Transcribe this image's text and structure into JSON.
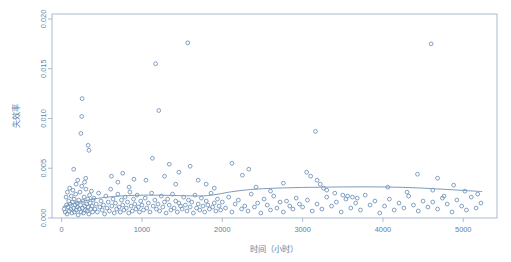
{
  "chart_data": {
    "type": "scatter",
    "title": "",
    "subtitle": "",
    "xlabel": "时间（小时）",
    "ylabel": "失效率",
    "xlim": [
      -120,
      5420
    ],
    "ylim": [
      0.0,
      0.0205
    ],
    "xticks": [
      0,
      1000,
      2000,
      3000,
      4000,
      5000
    ],
    "xtick_labels": [
      "0",
      "1000",
      "2000",
      "3000",
      "4000",
      "5000"
    ],
    "yticks": [
      0.0,
      0.005,
      0.01,
      0.015,
      0.02
    ],
    "ytick_labels": [
      "0.000",
      "0.005",
      "0.010",
      "0.015",
      "0.020"
    ],
    "grid": false,
    "legend": null,
    "legend_position": "none",
    "point_style": "open-circle",
    "point_color": "#6b8fb8",
    "curve_color": "#7d9bbd",
    "frame_color": "#9fb4cc",
    "axis_text_color": "#5b7fa6",
    "background_color": "#ffffff",
    "series": [
      {
        "name": "观测失效率",
        "type": "scatter",
        "points": [
          [
            30,
            0.0009
          ],
          [
            45,
            0.0006
          ],
          [
            55,
            0.0021
          ],
          [
            60,
            0.0013
          ],
          [
            68,
            0.0004
          ],
          [
            72,
            0.0026
          ],
          [
            80,
            0.0011
          ],
          [
            88,
            0.0017
          ],
          [
            95,
            0.0007
          ],
          [
            100,
            0.003
          ],
          [
            108,
            0.0014
          ],
          [
            115,
            0.0009
          ],
          [
            120,
            0.0022
          ],
          [
            128,
            0.0005
          ],
          [
            135,
            0.0016
          ],
          [
            140,
            0.0028
          ],
          [
            148,
            0.001
          ],
          [
            155,
            0.0019
          ],
          [
            160,
            0.0006
          ],
          [
            168,
            0.0013
          ],
          [
            175,
            0.0024
          ],
          [
            182,
            0.0008
          ],
          [
            190,
            0.0015
          ],
          [
            196,
            0.0011
          ],
          [
            205,
            0.0003
          ],
          [
            212,
            0.0018
          ],
          [
            220,
            0.0009
          ],
          [
            228,
            0.0026
          ],
          [
            235,
            0.0013
          ],
          [
            242,
            0.0006
          ],
          [
            250,
            0.0032
          ],
          [
            258,
            0.001
          ],
          [
            265,
            0.0017
          ],
          [
            272,
            0.0005
          ],
          [
            280,
            0.0021
          ],
          [
            288,
            0.0012
          ],
          [
            295,
            0.0008
          ],
          [
            302,
            0.0029
          ],
          [
            310,
            0.0014
          ],
          [
            318,
            0.0007
          ],
          [
            325,
            0.0019
          ],
          [
            332,
            0.0011
          ],
          [
            340,
            0.0004
          ],
          [
            348,
            0.0023
          ],
          [
            355,
            0.0015
          ],
          [
            362,
            0.0009
          ],
          [
            370,
            0.0027
          ],
          [
            378,
            0.0012
          ],
          [
            385,
            0.0006
          ],
          [
            392,
            0.0018
          ],
          [
            150,
            0.0049
          ],
          [
            240,
            0.0085
          ],
          [
            250,
            0.0102
          ],
          [
            255,
            0.012
          ],
          [
            330,
            0.0073
          ],
          [
            340,
            0.0068
          ],
          [
            300,
            0.004
          ],
          [
            285,
            0.0036
          ],
          [
            200,
            0.0038
          ],
          [
            180,
            0.0034
          ],
          [
            400,
            0.002
          ],
          [
            415,
            0.0009
          ],
          [
            430,
            0.0014
          ],
          [
            445,
            0.0006
          ],
          [
            460,
            0.0025
          ],
          [
            475,
            0.0011
          ],
          [
            490,
            0.0017
          ],
          [
            505,
            0.0008
          ],
          [
            520,
            0.0013
          ],
          [
            535,
            0.0004
          ],
          [
            550,
            0.0022
          ],
          [
            565,
            0.001
          ],
          [
            580,
            0.0016
          ],
          [
            595,
            0.0007
          ],
          [
            610,
            0.0029
          ],
          [
            625,
            0.0012
          ],
          [
            640,
            0.0019
          ],
          [
            655,
            0.0005
          ],
          [
            670,
            0.0015
          ],
          [
            685,
            0.0009
          ],
          [
            700,
            0.0024
          ],
          [
            715,
            0.0011
          ],
          [
            730,
            0.0006
          ],
          [
            745,
            0.0018
          ],
          [
            760,
            0.0013
          ],
          [
            775,
            0.0008
          ],
          [
            790,
            0.0021
          ],
          [
            805,
            0.001
          ],
          [
            820,
            0.0016
          ],
          [
            835,
            0.0005
          ],
          [
            850,
            0.0026
          ],
          [
            865,
            0.0012
          ],
          [
            880,
            0.0007
          ],
          [
            895,
            0.0019
          ],
          [
            910,
            0.0014
          ],
          [
            925,
            0.0009
          ],
          [
            940,
            0.0023
          ],
          [
            955,
            0.0011
          ],
          [
            970,
            0.0006
          ],
          [
            985,
            0.0017
          ],
          [
            620,
            0.0042
          ],
          [
            700,
            0.0036
          ],
          [
            760,
            0.0045
          ],
          [
            840,
            0.0031
          ],
          [
            900,
            0.0039
          ],
          [
            1000,
            0.0013
          ],
          [
            1020,
            0.0008
          ],
          [
            1040,
            0.002
          ],
          [
            1060,
            0.001
          ],
          [
            1080,
            0.0015
          ],
          [
            1100,
            0.0006
          ],
          [
            1120,
            0.0025
          ],
          [
            1140,
            0.0012
          ],
          [
            1160,
            0.0018
          ],
          [
            1180,
            0.0009
          ],
          [
            1200,
            0.0014
          ],
          [
            1220,
            0.0007
          ],
          [
            1240,
            0.0022
          ],
          [
            1260,
            0.0011
          ],
          [
            1280,
            0.0016
          ],
          [
            1300,
            0.0005
          ],
          [
            1320,
            0.0019
          ],
          [
            1340,
            0.0013
          ],
          [
            1360,
            0.0008
          ],
          [
            1380,
            0.0024
          ],
          [
            1400,
            0.001
          ],
          [
            1420,
            0.0017
          ],
          [
            1440,
            0.0006
          ],
          [
            1460,
            0.0015
          ],
          [
            1480,
            0.0012
          ],
          [
            1170,
            0.0155
          ],
          [
            1210,
            0.0108
          ],
          [
            1130,
            0.006
          ],
          [
            1280,
            0.0042
          ],
          [
            1340,
            0.0054
          ],
          [
            1050,
            0.0038
          ],
          [
            1420,
            0.0034
          ],
          [
            1460,
            0.0046
          ],
          [
            1500,
            0.0009
          ],
          [
            1520,
            0.0021
          ],
          [
            1540,
            0.0013
          ],
          [
            1560,
            0.0007
          ],
          [
            1580,
            0.0018
          ],
          [
            1600,
            0.0011
          ],
          [
            1620,
            0.0016
          ],
          [
            1640,
            0.0005
          ],
          [
            1660,
            0.0023
          ],
          [
            1680,
            0.001
          ],
          [
            1700,
            0.0014
          ],
          [
            1720,
            0.0008
          ],
          [
            1740,
            0.002
          ],
          [
            1760,
            0.0012
          ],
          [
            1780,
            0.0006
          ],
          [
            1800,
            0.0017
          ],
          [
            1820,
            0.0013
          ],
          [
            1840,
            0.0009
          ],
          [
            1860,
            0.0025
          ],
          [
            1880,
            0.0011
          ],
          [
            1900,
            0.0015
          ],
          [
            1920,
            0.0007
          ],
          [
            1940,
            0.0019
          ],
          [
            1960,
            0.0012
          ],
          [
            1980,
            0.0008
          ],
          [
            1570,
            0.0176
          ],
          [
            1600,
            0.0052
          ],
          [
            1700,
            0.0038
          ],
          [
            1800,
            0.0034
          ],
          [
            1900,
            0.003
          ],
          [
            2000,
            0.0016
          ],
          [
            2040,
            0.001
          ],
          [
            2080,
            0.0021
          ],
          [
            2120,
            0.0006
          ],
          [
            2160,
            0.0014
          ],
          [
            2200,
            0.0018
          ],
          [
            2240,
            0.0009
          ],
          [
            2280,
            0.0012
          ],
          [
            2320,
            0.0007
          ],
          [
            2360,
            0.0024
          ],
          [
            2400,
            0.0011
          ],
          [
            2440,
            0.0015
          ],
          [
            2480,
            0.0005
          ],
          [
            2520,
            0.0019
          ],
          [
            2560,
            0.0013
          ],
          [
            2600,
            0.0008
          ],
          [
            2640,
            0.0022
          ],
          [
            2680,
            0.001
          ],
          [
            2720,
            0.0016
          ],
          [
            2760,
            0.0006
          ],
          [
            2800,
            0.0017
          ],
          [
            2840,
            0.0012
          ],
          [
            2880,
            0.0009
          ],
          [
            2920,
            0.002
          ],
          [
            2960,
            0.0014
          ],
          [
            2120,
            0.0055
          ],
          [
            2250,
            0.0043
          ],
          [
            2420,
            0.0031
          ],
          [
            2600,
            0.0027
          ],
          [
            2760,
            0.0035
          ],
          [
            2330,
            0.0049
          ],
          [
            3000,
            0.0011
          ],
          [
            3060,
            0.0018
          ],
          [
            3120,
            0.0007
          ],
          [
            3180,
            0.0014
          ],
          [
            3240,
            0.0009
          ],
          [
            3300,
            0.0021
          ],
          [
            3360,
            0.0012
          ],
          [
            3420,
            0.0016
          ],
          [
            3480,
            0.0006
          ],
          [
            3540,
            0.0019
          ],
          [
            3600,
            0.001
          ],
          [
            3660,
            0.0015
          ],
          [
            3720,
            0.0008
          ],
          [
            3780,
            0.0023
          ],
          [
            3840,
            0.0013
          ],
          [
            3900,
            0.0017
          ],
          [
            3960,
            0.0005
          ],
          [
            3160,
            0.0087
          ],
          [
            3100,
            0.0042
          ],
          [
            3180,
            0.0038
          ],
          [
            3220,
            0.0034
          ],
          [
            3260,
            0.003
          ],
          [
            3300,
            0.0028
          ],
          [
            3400,
            0.0025
          ],
          [
            3500,
            0.0023
          ],
          [
            3560,
            0.0022
          ],
          [
            3620,
            0.0021
          ],
          [
            3680,
            0.002
          ],
          [
            3050,
            0.0046
          ],
          [
            4020,
            0.0012
          ],
          [
            4080,
            0.0019
          ],
          [
            4140,
            0.0008
          ],
          [
            4200,
            0.0015
          ],
          [
            4260,
            0.001
          ],
          [
            4320,
            0.0022
          ],
          [
            4380,
            0.0013
          ],
          [
            4440,
            0.0007
          ],
          [
            4500,
            0.0017
          ],
          [
            4560,
            0.0011
          ],
          [
            4620,
            0.0016
          ],
          [
            4680,
            0.0009
          ],
          [
            4740,
            0.002
          ],
          [
            4800,
            0.0014
          ],
          [
            4860,
            0.0006
          ],
          [
            4920,
            0.0018
          ],
          [
            4980,
            0.0012
          ],
          [
            5040,
            0.0008
          ],
          [
            5100,
            0.0021
          ],
          [
            5160,
            0.001
          ],
          [
            5220,
            0.0015
          ],
          [
            4600,
            0.0175
          ],
          [
            4060,
            0.0031
          ],
          [
            4430,
            0.0044
          ],
          [
            4680,
            0.004
          ],
          [
            4620,
            0.0028
          ],
          [
            4880,
            0.0033
          ],
          [
            5020,
            0.0027
          ],
          [
            5180,
            0.0024
          ],
          [
            4300,
            0.0026
          ],
          [
            4760,
            0.0022
          ]
        ]
      },
      {
        "name": "平滑拟合曲线",
        "type": "line",
        "points": [
          [
            20,
            0.00115
          ],
          [
            150,
            0.00145
          ],
          [
            300,
            0.00175
          ],
          [
            450,
            0.00198
          ],
          [
            650,
            0.00216
          ],
          [
            850,
            0.00226
          ],
          [
            1050,
            0.0023
          ],
          [
            1250,
            0.00229
          ],
          [
            1450,
            0.00225
          ],
          [
            1650,
            0.00222
          ],
          [
            1800,
            0.00224
          ],
          [
            1950,
            0.0024
          ],
          [
            2100,
            0.00262
          ],
          [
            2300,
            0.00282
          ],
          [
            2500,
            0.00294
          ],
          [
            2750,
            0.00302
          ],
          [
            3000,
            0.00307
          ],
          [
            3250,
            0.0031
          ],
          [
            3500,
            0.00312
          ],
          [
            3750,
            0.00313
          ],
          [
            4000,
            0.00312
          ],
          [
            4250,
            0.00308
          ],
          [
            4500,
            0.003
          ],
          [
            4750,
            0.00289
          ],
          [
            5000,
            0.00277
          ],
          [
            5230,
            0.00266
          ]
        ]
      }
    ]
  },
  "geometry": {
    "plot_left": 52,
    "plot_right": 497,
    "plot_top": 14,
    "plot_bottom": 218
  }
}
